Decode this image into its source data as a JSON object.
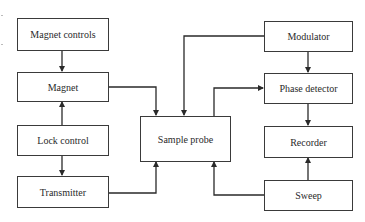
{
  "diagram": {
    "type": "block-diagram",
    "nodes": [
      {
        "id": "magnet_controls",
        "label": "Magnet controls"
      },
      {
        "id": "magnet",
        "label": "Magnet"
      },
      {
        "id": "lock_control",
        "label": "Lock control"
      },
      {
        "id": "transmitter",
        "label": "Transmitter"
      },
      {
        "id": "sample_probe",
        "label": "Sample probe"
      },
      {
        "id": "modulator",
        "label": "Modulator"
      },
      {
        "id": "phase_detector",
        "label": "Phase detector"
      },
      {
        "id": "recorder",
        "label": "Recorder"
      },
      {
        "id": "sweep",
        "label": "Sweep"
      }
    ],
    "edges": [
      {
        "from": "magnet_controls",
        "to": "magnet"
      },
      {
        "from": "lock_control",
        "to": "magnet"
      },
      {
        "from": "lock_control",
        "to": "transmitter"
      },
      {
        "from": "magnet",
        "to": "sample_probe"
      },
      {
        "from": "modulator",
        "to": "sample_probe"
      },
      {
        "from": "sample_probe",
        "to": "phase_detector"
      },
      {
        "from": "modulator",
        "to": "phase_detector"
      },
      {
        "from": "phase_detector",
        "to": "recorder"
      },
      {
        "from": "sweep",
        "to": "recorder"
      },
      {
        "from": "transmitter",
        "to": "sample_probe"
      },
      {
        "from": "sweep",
        "to": "sample_probe"
      }
    ],
    "colors": {
      "line": "#2a2a2a",
      "box_border": "#3a3a3a",
      "background": "#ffffff"
    }
  }
}
